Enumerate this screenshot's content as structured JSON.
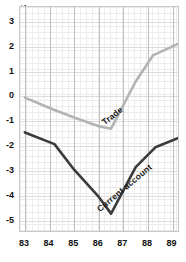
{
  "chart_data": {
    "type": "line",
    "title": "",
    "xlabel": "",
    "ylabel": "$bn",
    "x": [
      83,
      84,
      85,
      86,
      87,
      88,
      89
    ],
    "xtick_labels": [
      "83",
      "84",
      "85",
      "86",
      "87",
      "88",
      "89"
    ],
    "ytick_labels": [
      "3",
      "2",
      "1",
      "0",
      "-1",
      "-2",
      "-3",
      "-4",
      "-5"
    ],
    "ytick_values": [
      3,
      2,
      1,
      0,
      -1,
      -2,
      -3,
      -4,
      -5
    ],
    "xlim": [
      82.8,
      89.3
    ],
    "ylim": [
      -5.5,
      3.6
    ],
    "grid": true,
    "legend": "inline-labels",
    "series": [
      {
        "name": "Trade",
        "color": "#b3b3b3",
        "x": [
          83.0,
          84.2,
          85.0,
          86.0,
          86.5,
          87.5,
          88.2,
          89.3
        ],
        "values": [
          -0.05,
          -0.55,
          -0.85,
          -1.2,
          -1.3,
          0.6,
          1.65,
          2.15
        ],
        "label_text": "Trade",
        "label_angle": -38
      },
      {
        "name": "Current account",
        "color": "#3b3b3b",
        "x": [
          83.0,
          84.2,
          85.0,
          86.0,
          86.5,
          87.5,
          88.3,
          89.3
        ],
        "values": [
          -1.45,
          -1.92,
          -2.95,
          -4.05,
          -4.72,
          -2.85,
          -2.05,
          -1.65
        ],
        "label_text": "Current account",
        "label_angle": -40
      }
    ]
  },
  "axis": {
    "y_title": "$bn"
  }
}
